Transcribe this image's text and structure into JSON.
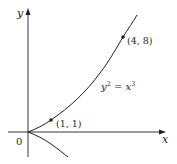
{
  "diagram": {
    "type": "function-graph",
    "equation": "y² = x³",
    "equation_parts": {
      "base1": "y",
      "exp1": "2",
      "eq": " = ",
      "base2": "x",
      "exp2": "3"
    },
    "axes": {
      "x_label": "x",
      "y_label": "y",
      "origin_label": "0"
    },
    "points": [
      {
        "label": "(1, 1)",
        "x": 1,
        "y": 1
      },
      {
        "label": "(4, 8)",
        "x": 4,
        "y": 8
      }
    ],
    "colors": {
      "ink": "#231f20",
      "background": "#ffffff"
    }
  }
}
